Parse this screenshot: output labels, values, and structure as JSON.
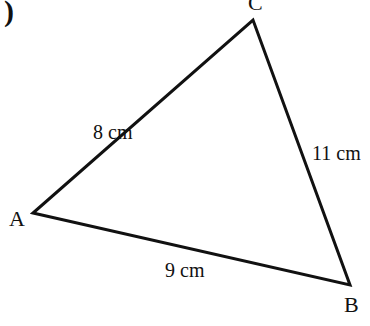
{
  "diagram": {
    "type": "triangle",
    "part_marker": ")",
    "vertices": [
      {
        "name": "A",
        "x": 33,
        "y": 213
      },
      {
        "name": "B",
        "x": 350,
        "y": 285
      },
      {
        "name": "C",
        "x": 253,
        "y": 20
      }
    ],
    "sides": [
      {
        "from": "A",
        "to": "C",
        "label": "8 cm"
      },
      {
        "from": "C",
        "to": "B",
        "label": "11 cm"
      },
      {
        "from": "A",
        "to": "B",
        "label": "9 cm"
      }
    ],
    "stroke_color": "#111111"
  }
}
